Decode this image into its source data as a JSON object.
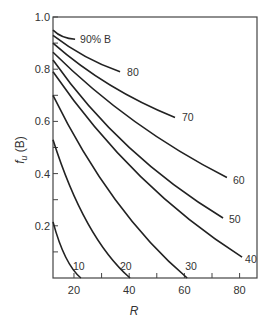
{
  "chart_data": {
    "type": "line",
    "title": "",
    "xlabel": "R",
    "ylabel": "f_u (B)",
    "xlim": [
      12.4,
      86.3
    ],
    "ylim": [
      0,
      1.0
    ],
    "x_ticks": [
      20,
      30,
      40,
      50,
      60,
      70,
      80
    ],
    "x_tick_labels": [
      "20",
      "",
      "40",
      "",
      "60",
      "",
      "80"
    ],
    "y_ticks": [
      0.1,
      0.2,
      0.3,
      0.4,
      0.5,
      0.6,
      0.7,
      0.8,
      0.9,
      1.0
    ],
    "y_tick_labels": [
      "",
      "0.2",
      "",
      "0.4",
      "",
      "0.6",
      "",
      "0.8",
      "",
      "1.0"
    ],
    "grid": false,
    "legend": "inline curve labels",
    "series": [
      {
        "name": "90% B",
        "label": "90% B",
        "x": [
          12.4,
          16,
          20.4
        ],
        "y": [
          0.95,
          0.925,
          0.915
        ]
      },
      {
        "name": "80",
        "label": "80",
        "x": [
          12.4,
          24,
          36.7
        ],
        "y": [
          0.93,
          0.85,
          0.79
        ]
      },
      {
        "name": "70",
        "label": "70",
        "x": [
          12.4,
          33,
          56.6
        ],
        "y": [
          0.9,
          0.74,
          0.615
        ]
      },
      {
        "name": "60",
        "label": "60",
        "x": [
          12.4,
          42,
          75.4
        ],
        "y": [
          0.865,
          0.6,
          0.385
        ]
      },
      {
        "name": "50",
        "label": "50",
        "x": [
          12.4,
          40,
          74.0
        ],
        "y": [
          0.835,
          0.5,
          0.23
        ]
      },
      {
        "name": "40",
        "label": "40",
        "x": [
          12.4,
          44,
          80.9
        ],
        "y": [
          0.79,
          0.39,
          0.08
        ]
      },
      {
        "name": "30",
        "label": "30",
        "x": [
          12.4,
          35,
          61.0
        ],
        "y": [
          0.7,
          0.3,
          0.0
        ]
      },
      {
        "name": "20",
        "label": "20",
        "x": [
          12.4,
          25,
          40.3
        ],
        "y": [
          0.53,
          0.21,
          0.0
        ]
      },
      {
        "name": "10",
        "label": "10",
        "x": [
          12.4,
          17,
          22.5
        ],
        "y": [
          0.215,
          0.08,
          0.0
        ]
      }
    ],
    "annotations": [
      "90% B",
      "80",
      "70",
      "60",
      "50",
      "40",
      "30",
      "20",
      "10"
    ]
  },
  "layout": {
    "plot": {
      "left": 53,
      "top": 17,
      "right": 257,
      "bottom": 278
    },
    "line_color": "#222222",
    "frame_color": "#444444",
    "label_offsets": {
      "90% B": [
        5,
        4
      ],
      "80": [
        7,
        4
      ],
      "70": [
        7,
        4
      ],
      "60": [
        6,
        6
      ],
      "50": [
        6,
        5
      ],
      "40": [
        3,
        6
      ],
      "30": [
        -2,
        -8
      ],
      "20": [
        -10,
        -8
      ],
      "10": [
        -8,
        -8
      ]
    }
  }
}
